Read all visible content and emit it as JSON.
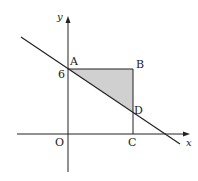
{
  "diagram": {
    "type": "coordinate-geometry",
    "axes": {
      "x_label": "x",
      "y_label": "y",
      "origin_label": "O"
    },
    "y_intercept_label": "6",
    "points": [
      {
        "name": "A",
        "label": "A"
      },
      {
        "name": "B",
        "label": "B"
      },
      {
        "name": "C",
        "label": "C"
      },
      {
        "name": "D",
        "label": "D"
      },
      {
        "name": "O",
        "label": "O"
      }
    ],
    "shaded_region": "triangle ABD",
    "line": "line through A and D",
    "colors": {
      "stroke": "#222222",
      "fill": "#d0d0d0"
    }
  }
}
